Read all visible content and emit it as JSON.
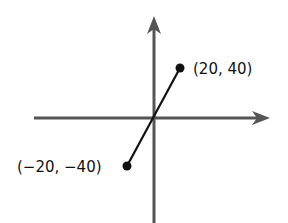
{
  "diagram": {
    "type": "coordinate-plane-line-segment",
    "axes": {
      "color": "#555555",
      "x_axis": {
        "x1": 34,
        "x2": 269,
        "y": 118
      },
      "y_axis": {
        "x": 154,
        "y1": 17,
        "y2": 223
      }
    },
    "segment": {
      "color": "#111111",
      "endpoints": [
        {
          "label": "(20, 40)",
          "x": 20,
          "y": 40,
          "px": 180,
          "py": 68
        },
        {
          "label": "(−20, −40)",
          "x": -20,
          "y": -40,
          "px": 127,
          "py": 166
        }
      ]
    }
  }
}
